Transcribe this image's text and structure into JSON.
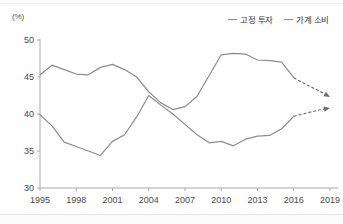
{
  "chart_data": {
    "type": "line",
    "title": "",
    "xlabel": "",
    "ylabel": "",
    "unit_label": "(%)",
    "xlim": [
      1995,
      2019
    ],
    "ylim": [
      30,
      50
    ],
    "yticks": [
      50,
      45,
      40,
      35,
      30
    ],
    "xticks": [
      1995,
      1998,
      2001,
      2004,
      2007,
      2010,
      2013,
      2016,
      2019
    ],
    "grid": false,
    "legend_position": "top-right",
    "x": [
      1995,
      1996,
      1997,
      1998,
      1999,
      2000,
      2001,
      2002,
      2003,
      2004,
      2005,
      2006,
      2007,
      2008,
      2009,
      2010,
      2011,
      2012,
      2013,
      2014,
      2015,
      2016,
      2017,
      2018,
      2019
    ],
    "series": [
      {
        "name": "고정 투자",
        "color": "#8c8c8c",
        "values": [
          45.3,
          46.6,
          46.0,
          45.4,
          45.3,
          46.3,
          46.7,
          46.0,
          45.0,
          43.0,
          41.5,
          40.6,
          41.0,
          42.4,
          45.2,
          48.0,
          48.2,
          48.1,
          47.3,
          47.2,
          47.0,
          44.9,
          44.0,
          43.2,
          42.3
        ],
        "forecast_from": 2016,
        "forecast_values": [
          44.9,
          44.0,
          43.2,
          42.3
        ],
        "forecast_arrow": true
      },
      {
        "name": "가계 소비",
        "color": "#8c8c8c",
        "values": [
          39.9,
          38.4,
          36.2,
          35.6,
          35.0,
          34.4,
          36.3,
          37.2,
          39.6,
          42.5,
          41.2,
          40.0,
          38.6,
          37.2,
          36.1,
          36.3,
          35.7,
          36.6,
          37.0,
          37.1,
          38.0,
          39.7,
          40.1,
          40.5,
          40.8
        ],
        "forecast_from": 2016,
        "forecast_values": [
          39.7,
          40.1,
          40.5,
          40.8
        ],
        "forecast_arrow": true
      }
    ]
  },
  "legend": {
    "items": [
      {
        "label": "고정 투자"
      },
      {
        "label": "가계 소비"
      }
    ]
  },
  "axes": {
    "unit": "(%)",
    "y_labels": [
      "50",
      "45",
      "40",
      "35",
      "30"
    ],
    "x_labels": [
      "1995",
      "1998",
      "2001",
      "2004",
      "2007",
      "2010",
      "2013",
      "2016",
      "2019"
    ]
  }
}
